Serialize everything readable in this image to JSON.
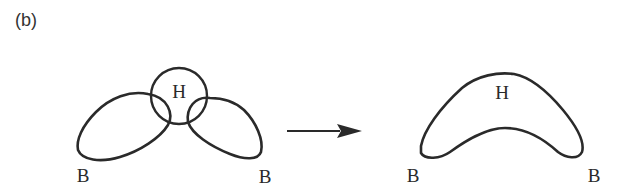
{
  "panel_label": "(b)",
  "left_diagram": {
    "center_atom": "H",
    "left_atom": "B",
    "right_atom": "B",
    "description": "Two B orbital lobes overlapping an H circle (separate orbitals)"
  },
  "arrow": {
    "direction": "right"
  },
  "right_diagram": {
    "center_atom": "H",
    "left_atom": "B",
    "right_atom": "B",
    "description": "Combined banana-shaped three-center bonding orbital"
  },
  "colors": {
    "stroke": "#2a2a2a",
    "background": "#ffffff"
  }
}
